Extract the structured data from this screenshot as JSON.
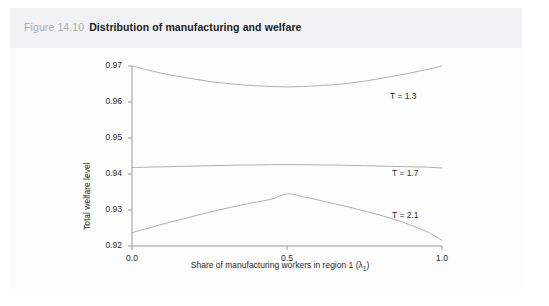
{
  "figure": {
    "number": "Figure 14.10",
    "title": "Distribution of manufacturing and welfare"
  },
  "chart_data": {
    "type": "line",
    "title": "Distribution of manufacturing and welfare",
    "xlabel": "Share of manufacturing workers in region 1 (λ1)",
    "xlabel_text": "Share of manufacturing workers in region 1 (",
    "xlabel_symbol": "λ",
    "xlabel_subscript": "1",
    "xlabel_close": ")",
    "ylabel": "Total welfare level",
    "xlim": [
      0.0,
      1.0
    ],
    "ylim": [
      0.92,
      0.97
    ],
    "xticks": [
      "0.0",
      "0.5",
      "1.0"
    ],
    "xtick_values": [
      0.0,
      0.5,
      1.0
    ],
    "yticks": [
      "0.92",
      "0.93",
      "0.94",
      "0.95",
      "0.96",
      "0.97"
    ],
    "ytick_values": [
      0.92,
      0.93,
      0.94,
      0.95,
      0.96,
      0.97
    ],
    "grid": false,
    "legend_position": "inline-right",
    "line_color": "#b0b0b0",
    "x": [
      0.0,
      0.05,
      0.1,
      0.15,
      0.2,
      0.25,
      0.3,
      0.35,
      0.4,
      0.45,
      0.5,
      0.55,
      0.6,
      0.65,
      0.7,
      0.75,
      0.8,
      0.85,
      0.9,
      0.95,
      1.0
    ],
    "series": [
      {
        "name": "T = 1.3",
        "label": "T = 1.3",
        "shape": "u-shaped",
        "values": [
          0.97,
          0.9689,
          0.9679,
          0.9671,
          0.9664,
          0.9657,
          0.9652,
          0.9648,
          0.9645,
          0.9643,
          0.9642,
          0.9643,
          0.9645,
          0.9648,
          0.9652,
          0.9658,
          0.9665,
          0.9673,
          0.9681,
          0.969,
          0.97
        ]
      },
      {
        "name": "T = 1.7",
        "label": "T = 1.7",
        "shape": "nearly-flat",
        "values": [
          0.9418,
          0.9419,
          0.942,
          0.9421,
          0.9422,
          0.9423,
          0.9424,
          0.9425,
          0.9425,
          0.9426,
          0.9426,
          0.9426,
          0.9425,
          0.9425,
          0.9424,
          0.9423,
          0.9422,
          0.9421,
          0.942,
          0.9419,
          0.9417
        ]
      },
      {
        "name": "T = 2.1",
        "label": "T = 2.1",
        "shape": "hump-shaped",
        "values": [
          0.9237,
          0.9249,
          0.9261,
          0.9272,
          0.9283,
          0.9294,
          0.9304,
          0.9313,
          0.9322,
          0.933,
          0.9345,
          0.9337,
          0.9328,
          0.9318,
          0.9308,
          0.9297,
          0.9286,
          0.9273,
          0.9258,
          0.924,
          0.9216
        ]
      }
    ]
  }
}
